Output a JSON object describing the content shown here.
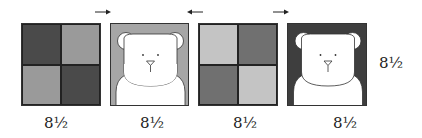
{
  "figure": {
    "colors": {
      "dark": "#4a4a4a",
      "medium_dark": "#707070",
      "medium": "#9a9a9a",
      "light": "#c4c4c4",
      "panel2_bg": "#a6a6a6",
      "panel4_bg": "#3e3e3e",
      "bear": "#ffffff",
      "line": "#333333"
    },
    "arrows": [
      {
        "direction": "right",
        "label": "arrow-right"
      },
      {
        "direction": "left",
        "label": "arrow-left"
      },
      {
        "direction": "right",
        "label": "arrow-right"
      }
    ],
    "panels": [
      {
        "type": "checker",
        "quadrants": [
          "dark",
          "medium",
          "medium",
          "dark"
        ],
        "width_label": "8½"
      },
      {
        "type": "bear",
        "background": "panel2_bg",
        "width_label": "8½"
      },
      {
        "type": "checker",
        "quadrants": [
          "light",
          "medium_dark",
          "medium_dark",
          "light"
        ],
        "width_label": "8½"
      },
      {
        "type": "bear",
        "background": "panel4_bg",
        "width_label": "8½"
      }
    ],
    "height_label": "8½"
  }
}
